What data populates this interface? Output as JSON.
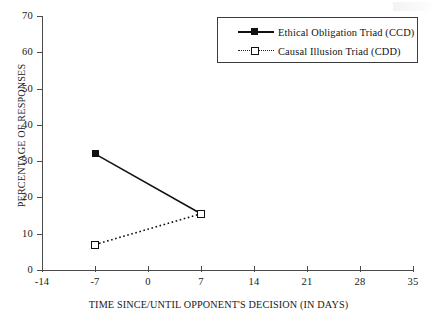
{
  "chart_data": {
    "type": "line",
    "title": "",
    "xlabel": "TIME SINCE/UNTIL OPPONENT'S DECISION (IN DAYS)",
    "ylabel": "PERCENTAGE OF RESPONSES",
    "xlim": [
      -14,
      35
    ],
    "ylim": [
      0,
      70
    ],
    "xticks": [
      -14,
      -7,
      0,
      7,
      14,
      21,
      28,
      35
    ],
    "xtick_labels": [
      "-14",
      "-7",
      "0",
      "7",
      "14",
      "21",
      "28",
      "35"
    ],
    "yticks": [
      0,
      10,
      20,
      30,
      40,
      50,
      60,
      70
    ],
    "ytick_labels": [
      "0",
      "10",
      "20",
      "30",
      "40",
      "50",
      "60",
      "70"
    ],
    "grid": false,
    "legend_position": "top-right",
    "x": [
      -7,
      7
    ],
    "series": [
      {
        "name": "Ethical Obligation Triad (CCD)",
        "values": [
          32,
          15.5
        ],
        "line_style": "solid",
        "marker": "filled-square",
        "color": "#101010"
      },
      {
        "name": "Causal Illusion Triad (CDD)",
        "values": [
          7,
          15.5
        ],
        "line_style": "dotted",
        "marker": "open-square",
        "color": "#101010"
      }
    ]
  },
  "legend": {
    "items": [
      {
        "label": "Ethical Obligation Triad (CCD)"
      },
      {
        "label": "Causal Illusion Triad (CDD)"
      }
    ]
  },
  "axes": {
    "x_title": "TIME SINCE/UNTIL OPPONENT'S DECISION (IN DAYS)",
    "y_title": "PERCENTAGE OF RESPONSES",
    "x_ticks": [
      "-14",
      "-7",
      "0",
      "7",
      "14",
      "21",
      "28",
      "35"
    ],
    "y_ticks": [
      "70",
      "60",
      "50",
      "40",
      "30",
      "20",
      "10",
      "0"
    ]
  }
}
